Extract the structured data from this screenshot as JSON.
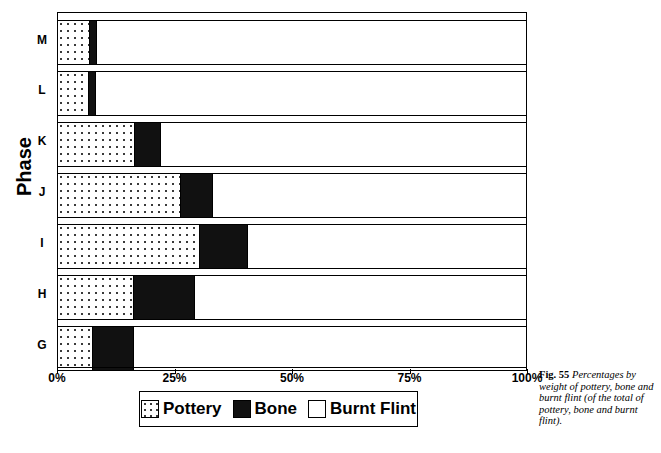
{
  "figure": {
    "number_label": "Fig. 55",
    "caption": "Percentages by weight of pottery, bone and burnt flint (of the total of pottery, bone and burnt flint)."
  },
  "chart_data": {
    "type": "bar",
    "orientation": "horizontal",
    "stacked": true,
    "normalized_percent": true,
    "title": "",
    "xlabel": "",
    "ylabel": "Phase",
    "xlim": [
      0,
      100
    ],
    "grid": false,
    "legend_position": "bottom",
    "categories": [
      "M",
      "L",
      "K",
      "J",
      "I",
      "H",
      "G"
    ],
    "xtick_labels": [
      "0%",
      "25%",
      "50%",
      "75%",
      "100%"
    ],
    "xtick_values": [
      0,
      25,
      50,
      75,
      100
    ],
    "series": [
      {
        "name": "Pottery",
        "fill": "dotted",
        "values": [
          6.8,
          6.6,
          16.4,
          26.2,
          30.4,
          16.2,
          7.4
        ]
      },
      {
        "name": "Bone",
        "fill": "solid-black",
        "values": [
          1.3,
          1.3,
          5.3,
          6.8,
          10.0,
          12.8,
          8.6
        ]
      },
      {
        "name": "Burnt Flint",
        "fill": "white",
        "values": [
          91.9,
          92.1,
          78.3,
          67.0,
          59.6,
          71.0,
          84.0
        ]
      }
    ],
    "bars": [
      {
        "category": "M",
        "pottery": 6.8,
        "bone": 1.3,
        "burnt_flint": 91.9
      },
      {
        "category": "L",
        "pottery": 6.6,
        "bone": 1.3,
        "burnt_flint": 92.1
      },
      {
        "category": "K",
        "pottery": 16.4,
        "bone": 5.3,
        "burnt_flint": 78.3
      },
      {
        "category": "J",
        "pottery": 26.2,
        "bone": 6.8,
        "burnt_flint": 67.0
      },
      {
        "category": "I",
        "pottery": 30.4,
        "bone": 10.0,
        "burnt_flint": 59.6
      },
      {
        "category": "H",
        "pottery": 16.2,
        "bone": 12.8,
        "burnt_flint": 71.0
      },
      {
        "category": "G",
        "pottery": 7.4,
        "bone": 8.6,
        "burnt_flint": 84.0
      }
    ]
  },
  "legend": {
    "entries": [
      {
        "label": "Pottery",
        "swatch": "dotted"
      },
      {
        "label": "Bone",
        "swatch": "solid-black"
      },
      {
        "label": "Burnt Flint",
        "swatch": "white"
      }
    ]
  },
  "colors": {
    "ink": "#000000",
    "bone_fill": "#111111",
    "pottery_dot": "#3a3a3a",
    "background": "#ffffff"
  }
}
